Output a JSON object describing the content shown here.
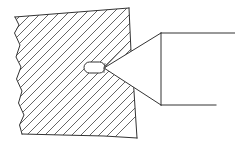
{
  "figure": {
    "background_color": "#ffffff",
    "line_color": "#333333",
    "hatch_color": "#4a4a4a",
    "width": 235,
    "height": 149
  },
  "parts": {
    "workpiece": {
      "name": "hatched-section-block",
      "description": "Cross-hatched sectioned block with wavy break line on left edge",
      "outline_points": "129,8 131.5,62 133,76 137,138 104,136 62,135 22,134 20,124 24,114 19,102 22,90 17,78 21,66 16,56 20,44 15,32 19,24 15,17",
      "hatch_angle_deg": 45,
      "hatch_spacing_px": 9,
      "fill_color": "#ffffff"
    },
    "cavity": {
      "name": "capsule-cavity",
      "description": "Small rounded rectangular cavity at the centre of the block",
      "x": 84,
      "y": 62,
      "width": 21,
      "height": 11,
      "corner_radius": 5,
      "fill_color": "#ffffff"
    },
    "cone_tool": {
      "name": "conical-punch",
      "description": "Conical punch pointing left toward the cavity, with cylindrical shank extending right",
      "tip_x": 104,
      "tip_y": 68,
      "cone_top": "161,33",
      "cone_bottom": "161,105",
      "shank_top_end_x": 235,
      "shank_bottom_end_x": 216,
      "fill_color": "#ffffff"
    },
    "leader_lines": {
      "name": "detail-leader-lines",
      "description": "Two thin leader lines running from the cone tip back to the cavity corners",
      "upper": "104,68 106,66",
      "lower": "104,68 103,71"
    }
  },
  "labels": {
    "workpiece_label": "",
    "cone_label": "",
    "cavity_label": ""
  }
}
